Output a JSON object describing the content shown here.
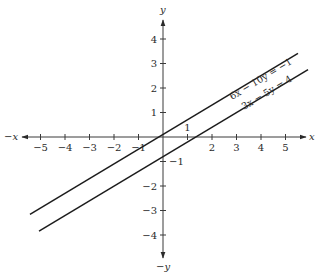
{
  "chart_data": {
    "type": "line",
    "title": "",
    "xlabel": "x",
    "ylabel": "y",
    "xlabel_negative": "−x",
    "ylabel_negative": "−y",
    "xlim": [
      -5.6,
      5.9
    ],
    "ylim": [
      -4.6,
      4.6
    ],
    "grid": false,
    "legend": "none (equations labeled inline along lines)",
    "x_ticks": [
      -5,
      -4,
      -3,
      -2,
      -1,
      1,
      2,
      3,
      4,
      5
    ],
    "x_tick_labels": [
      "−5",
      "−4",
      "−3",
      "−2",
      "−1",
      "1",
      "2",
      "3",
      "4",
      "5"
    ],
    "y_ticks": [
      -4,
      -3,
      -2,
      -1,
      1,
      2,
      3,
      4
    ],
    "y_tick_labels": [
      "−4",
      "−3",
      "−2",
      "−1",
      "1",
      "2",
      "3",
      "4"
    ],
    "series": [
      {
        "name": "6x − 10y = −1",
        "label": "6x − 10y = −1",
        "equation": "y = 0.6x + 0.1",
        "x": [
          -5.43,
          5.51
        ],
        "y": [
          -3.16,
          3.41
        ]
      },
      {
        "name": "3x − 5y = 4",
        "label": "3x − 5y = 4",
        "equation": "y = 0.6x − 0.8",
        "x": [
          -5.06,
          5.92
        ],
        "y": [
          -3.84,
          2.75
        ]
      }
    ],
    "annotations": [
      "1",
      "−1"
    ]
  }
}
